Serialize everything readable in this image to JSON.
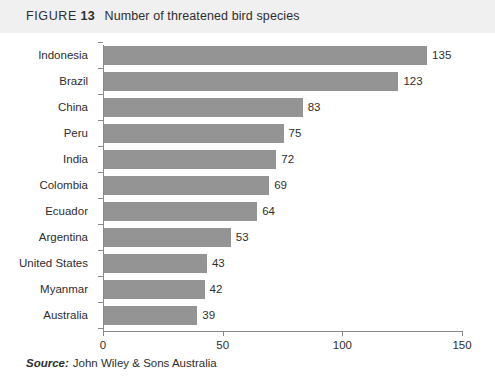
{
  "figure": {
    "label_word": "FIGURE",
    "number": "13",
    "caption": "Number of threatened bird species"
  },
  "source": {
    "label": "Source:",
    "text": "John Wiley & Sons Australia"
  },
  "colors": {
    "bar": "#949494",
    "title_band": "#f0f0f0",
    "axis": "#8a8a8a",
    "text": "#2e2e2e"
  },
  "chart_data": {
    "type": "bar",
    "orientation": "horizontal",
    "title": "Number of threatened bird species",
    "xlabel": "",
    "ylabel": "",
    "xlim": [
      0,
      150
    ],
    "xticks": [
      "0",
      "50",
      "100",
      "150"
    ],
    "grid": false,
    "legend": "none",
    "data_labels": true,
    "categories": [
      "Indonesia",
      "Brazil",
      "China",
      "Peru",
      "India",
      "Colombia",
      "Ecuador",
      "Argentina",
      "United States",
      "Myanmar",
      "Australia"
    ],
    "values": [
      135,
      123,
      83,
      75,
      72,
      69,
      64,
      53,
      43,
      42,
      39
    ]
  }
}
